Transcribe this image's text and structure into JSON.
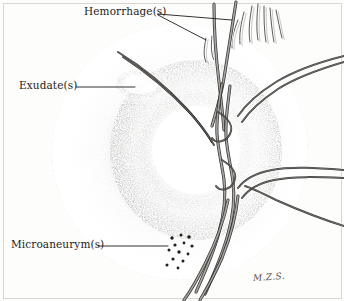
{
  "figure": {
    "medium": "pen-and-ink stipple drawing",
    "signature": "M.Z.S.",
    "background_color": "#fdfdfc",
    "ink_color": "#1e1c1a",
    "frame_color": "#d8d6d2"
  },
  "labels": {
    "hemorrhage": "Hemorrhage(s)",
    "exudate": "Exudate(s)",
    "microaneurysm": "Microaneurym(s)"
  },
  "leader_lines": [
    {
      "name": "hemorrhage-leader-upper",
      "from_label": "hemorrhage",
      "x1": 158,
      "y1": 14,
      "x2": 232,
      "y2": 20
    },
    {
      "name": "hemorrhage-leader-lower",
      "from_label": "hemorrhage",
      "x1": 158,
      "y1": 15,
      "x2": 206,
      "y2": 40
    },
    {
      "name": "exudate-leader",
      "from_label": "exudate",
      "x1": 76,
      "y1": 87,
      "x2": 135,
      "y2": 87
    },
    {
      "name": "microaneurysm-leader",
      "from_label": "microaneurysm",
      "x1": 98,
      "y1": 246,
      "x2": 168,
      "y2": 246
    }
  ],
  "anatomy": {
    "optic_disc": {
      "name": "optic-disc",
      "cx": 196,
      "cy": 150,
      "r": 46,
      "fill": "#ffffff"
    },
    "fundus_field": {
      "name": "fundus-field",
      "cx": 180,
      "cy": 152,
      "rx": 128,
      "ry": 128
    }
  },
  "findings": [
    {
      "name": "flame-hemorrhages",
      "label": "Hemorrhage(s)",
      "region": "superior-temporal",
      "count": 9
    },
    {
      "name": "hard-exudate-patch",
      "label": "Exudate(s)",
      "region": "temporal-macular",
      "count": 1
    },
    {
      "name": "microaneurysm-dots",
      "label": "Microaneurym(s)",
      "region": "inferior-temporal",
      "count": 13
    }
  ],
  "microaneurysm_dots": [
    {
      "cx": 172,
      "cy": 238,
      "r": 1.7
    },
    {
      "cx": 181,
      "cy": 235,
      "r": 1.5
    },
    {
      "cx": 189,
      "cy": 237,
      "r": 1.8
    },
    {
      "cx": 175,
      "cy": 245,
      "r": 1.6
    },
    {
      "cx": 184,
      "cy": 243,
      "r": 1.4
    },
    {
      "cx": 192,
      "cy": 246,
      "r": 1.6
    },
    {
      "cx": 169,
      "cy": 250,
      "r": 1.5
    },
    {
      "cx": 179,
      "cy": 252,
      "r": 1.7
    },
    {
      "cx": 188,
      "cy": 254,
      "r": 1.4
    },
    {
      "cx": 173,
      "cy": 259,
      "r": 1.6
    },
    {
      "cx": 183,
      "cy": 261,
      "r": 1.5
    },
    {
      "cx": 167,
      "cy": 265,
      "r": 1.5
    },
    {
      "cx": 178,
      "cy": 268,
      "r": 1.4
    }
  ],
  "vessels": [
    {
      "name": "superior-nasal-arcade",
      "d": "M 236 2 C 232 26 228 54 224 78 C 221 96 216 112 212 126"
    },
    {
      "name": "superior-temporal-arcade",
      "d": "M 214 4 C 214 30 216 58 219 82 C 221 100 223 116 224 130"
    },
    {
      "name": "superior-branch-left",
      "d": "M 118 52 C 144 68 168 88 186 108 C 198 121 206 132 212 142"
    },
    {
      "name": "superior-branch-left-2",
      "d": "M 123 57 C 149 74 172 94 190 113 C 201 125 208 135 214 145"
    },
    {
      "name": "central-trunk",
      "d": "M 222 84 C 219 102 216 118 217 134 C 218 150 222 164 224 180 C 226 196 224 214 219 232 C 214 252 205 272 196 292"
    },
    {
      "name": "central-trunk-2",
      "d": "M 230 86 C 228 104 225 120 226 136 C 227 152 231 166 233 182 C 235 198 233 216 228 234 C 223 254 214 274 205 294"
    },
    {
      "name": "nasal-upper-exit",
      "d": "M 344 56 C 320 62 296 70 276 82 C 260 92 246 104 238 116"
    },
    {
      "name": "nasal-upper-exit-2",
      "d": "M 344 62 C 320 69 297 77 278 89 C 263 99 250 110 242 122"
    },
    {
      "name": "temporal-right-exit",
      "d": "M 344 170 C 318 168 292 166 272 170 C 256 173 244 180 238 188"
    },
    {
      "name": "temporal-right-exit-2",
      "d": "M 344 178 C 318 177 293 176 274 180 C 259 183 248 190 242 198"
    },
    {
      "name": "inferior-right-branch",
      "d": "M 344 226 C 318 218 294 208 276 200 C 262 193 252 188 245 186"
    },
    {
      "name": "inferior-temporal-descending",
      "d": "M 238 196 C 236 216 230 238 222 258 C 214 276 206 290 200 300"
    },
    {
      "name": "inferior-nasal-descending",
      "d": "M 228 200 C 224 220 216 242 206 262 C 198 278 190 292 184 300"
    },
    {
      "name": "disc-loop-upper",
      "d": "M 218 112 C 228 118 234 126 230 134 C 226 142 216 144 212 138"
    },
    {
      "name": "disc-loop-lower",
      "d": "M 222 160 C 232 166 238 174 234 182 C 230 190 220 192 216 186"
    }
  ],
  "hemorrhage_flames": [
    {
      "name": "flame-1",
      "d": "M 252 6 C 250 18 248 30 250 42"
    },
    {
      "name": "flame-2",
      "d": "M 258 4 C 257 16 256 28 258 40"
    },
    {
      "name": "flame-3",
      "d": "M 264 6 C 264 18 264 30 266 42"
    },
    {
      "name": "flame-4",
      "d": "M 270 8 C 271 20 272 32 274 42"
    },
    {
      "name": "flame-5",
      "d": "M 276 10 C 278 20 280 30 282 38"
    },
    {
      "name": "flame-6",
      "d": "M 244 12 C 241 24 239 34 240 44"
    },
    {
      "name": "flame-7",
      "d": "M 238 20 C 234 30 231 40 232 48"
    },
    {
      "name": "flame-8",
      "d": "M 206 38 C 204 48 203 56 206 62"
    },
    {
      "name": "flame-9",
      "d": "M 212 36 C 211 46 211 54 214 60"
    }
  ]
}
